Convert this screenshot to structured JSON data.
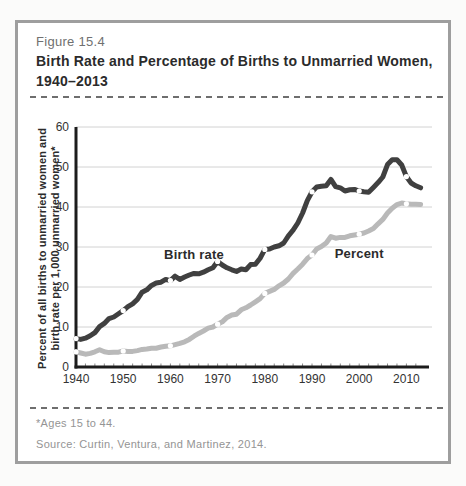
{
  "figure": {
    "label": "Figure 15.4",
    "title_lines": [
      "Birth Rate and Percentage of Births to Unmarried Women,",
      "1940–2013"
    ]
  },
  "colors": {
    "birth_rate_line": "#404040",
    "percent_line": "#b9b9b9",
    "grid": "#d2d2d2",
    "axis": "#1c1c1c",
    "minor_tick": "#8a8a8a",
    "marker_fill": "#ffffff",
    "panel_border": "#9e9e9e"
  },
  "chart_data": {
    "type": "line",
    "title": "Birth Rate and Percentage of Births to Unmarried Women, 1940–2013",
    "xlabel": "",
    "ylabel": "Percent of all births to unmarried women and birth rate per 1,000 unmarried women*",
    "ylabel_lines": [
      "Percent of all births to unmarried women and",
      "birth rate per 1,000 unmarried women*"
    ],
    "xlim": [
      1940,
      2015
    ],
    "ylim": [
      0,
      60
    ],
    "x_ticks": [
      1940,
      1950,
      1960,
      1970,
      1980,
      1990,
      2000,
      2010
    ],
    "y_ticks": [
      0,
      10,
      20,
      30,
      40,
      50,
      60
    ],
    "grid": "horizontal",
    "legend_position": "inline-labels",
    "series": [
      {
        "name": "Percent",
        "color": "#b9b9b9",
        "marker_years": [
          1940,
          1950,
          1960,
          1970,
          1980,
          1990,
          2000,
          2010
        ],
        "points": [
          [
            1940,
            3.8
          ],
          [
            1941,
            3.5
          ],
          [
            1942,
            3.2
          ],
          [
            1943,
            3.4
          ],
          [
            1944,
            3.8
          ],
          [
            1945,
            4.3
          ],
          [
            1946,
            3.8
          ],
          [
            1947,
            3.6
          ],
          [
            1948,
            3.7
          ],
          [
            1949,
            3.7
          ],
          [
            1950,
            4.0
          ],
          [
            1951,
            3.9
          ],
          [
            1952,
            3.9
          ],
          [
            1953,
            4.1
          ],
          [
            1954,
            4.4
          ],
          [
            1955,
            4.5
          ],
          [
            1956,
            4.7
          ],
          [
            1957,
            4.7
          ],
          [
            1958,
            5.0
          ],
          [
            1959,
            5.2
          ],
          [
            1960,
            5.3
          ],
          [
            1961,
            5.6
          ],
          [
            1962,
            5.9
          ],
          [
            1963,
            6.3
          ],
          [
            1964,
            6.9
          ],
          [
            1965,
            7.7
          ],
          [
            1966,
            8.4
          ],
          [
            1967,
            9.0
          ],
          [
            1968,
            9.7
          ],
          [
            1969,
            10.0
          ],
          [
            1970,
            10.7
          ],
          [
            1971,
            11.3
          ],
          [
            1972,
            12.4
          ],
          [
            1973,
            13.0
          ],
          [
            1974,
            13.2
          ],
          [
            1975,
            14.3
          ],
          [
            1976,
            14.8
          ],
          [
            1977,
            15.5
          ],
          [
            1978,
            16.3
          ],
          [
            1979,
            17.1
          ],
          [
            1980,
            18.4
          ],
          [
            1981,
            18.9
          ],
          [
            1982,
            19.4
          ],
          [
            1983,
            20.3
          ],
          [
            1984,
            21.0
          ],
          [
            1985,
            22.0
          ],
          [
            1986,
            23.4
          ],
          [
            1987,
            24.5
          ],
          [
            1988,
            25.7
          ],
          [
            1989,
            27.1
          ],
          [
            1990,
            28.0
          ],
          [
            1991,
            29.5
          ],
          [
            1992,
            30.1
          ],
          [
            1993,
            31.0
          ],
          [
            1994,
            32.6
          ],
          [
            1995,
            32.2
          ],
          [
            1996,
            32.4
          ],
          [
            1997,
            32.4
          ],
          [
            1998,
            32.8
          ],
          [
            1999,
            33.0
          ],
          [
            2000,
            33.2
          ],
          [
            2001,
            33.5
          ],
          [
            2002,
            34.0
          ],
          [
            2003,
            34.6
          ],
          [
            2004,
            35.8
          ],
          [
            2005,
            36.9
          ],
          [
            2006,
            38.5
          ],
          [
            2007,
            39.7
          ],
          [
            2008,
            40.6
          ],
          [
            2009,
            41.0
          ],
          [
            2010,
            40.8
          ],
          [
            2011,
            40.7
          ],
          [
            2012,
            40.7
          ],
          [
            2013,
            40.6
          ]
        ]
      },
      {
        "name": "Birth rate",
        "color": "#404040",
        "marker_years": [
          1940,
          1950,
          1960,
          1970,
          1980,
          1990,
          2000,
          2010
        ],
        "points": [
          [
            1940,
            7.1
          ],
          [
            1941,
            6.9
          ],
          [
            1942,
            7.2
          ],
          [
            1943,
            7.8
          ],
          [
            1944,
            8.6
          ],
          [
            1945,
            10.1
          ],
          [
            1946,
            10.9
          ],
          [
            1947,
            12.1
          ],
          [
            1948,
            12.5
          ],
          [
            1949,
            13.3
          ],
          [
            1950,
            14.1
          ],
          [
            1951,
            15.1
          ],
          [
            1952,
            15.8
          ],
          [
            1953,
            16.9
          ],
          [
            1954,
            18.7
          ],
          [
            1955,
            19.3
          ],
          [
            1956,
            20.4
          ],
          [
            1957,
            21.0
          ],
          [
            1958,
            21.2
          ],
          [
            1959,
            21.9
          ],
          [
            1960,
            21.6
          ],
          [
            1961,
            22.7
          ],
          [
            1962,
            21.9
          ],
          [
            1963,
            22.5
          ],
          [
            1964,
            23.0
          ],
          [
            1965,
            23.4
          ],
          [
            1966,
            23.3
          ],
          [
            1967,
            23.7
          ],
          [
            1968,
            24.3
          ],
          [
            1969,
            24.8
          ],
          [
            1970,
            26.4
          ],
          [
            1971,
            25.5
          ],
          [
            1972,
            24.8
          ],
          [
            1973,
            24.3
          ],
          [
            1974,
            23.9
          ],
          [
            1975,
            24.5
          ],
          [
            1976,
            24.3
          ],
          [
            1977,
            25.6
          ],
          [
            1978,
            25.7
          ],
          [
            1979,
            27.2
          ],
          [
            1980,
            29.4
          ],
          [
            1981,
            29.5
          ],
          [
            1982,
            30.0
          ],
          [
            1983,
            30.3
          ],
          [
            1984,
            31.0
          ],
          [
            1985,
            32.8
          ],
          [
            1986,
            34.2
          ],
          [
            1987,
            36.0
          ],
          [
            1988,
            38.5
          ],
          [
            1989,
            41.6
          ],
          [
            1990,
            43.8
          ],
          [
            1991,
            45.0
          ],
          [
            1992,
            45.2
          ],
          [
            1993,
            45.3
          ],
          [
            1994,
            46.9
          ],
          [
            1995,
            45.1
          ],
          [
            1996,
            44.8
          ],
          [
            1997,
            44.0
          ],
          [
            1998,
            44.3
          ],
          [
            1999,
            44.4
          ],
          [
            2000,
            44.0
          ],
          [
            2001,
            43.8
          ],
          [
            2002,
            43.7
          ],
          [
            2003,
            44.9
          ],
          [
            2004,
            46.1
          ],
          [
            2005,
            47.5
          ],
          [
            2006,
            50.6
          ],
          [
            2007,
            51.8
          ],
          [
            2008,
            51.8
          ],
          [
            2009,
            50.5
          ],
          [
            2010,
            47.6
          ],
          [
            2011,
            46.0
          ],
          [
            2012,
            45.3
          ],
          [
            2013,
            44.8
          ]
        ]
      }
    ],
    "annotations": [
      {
        "text": "Birth rate",
        "year": 1965,
        "value": 27.0
      },
      {
        "text": "Percent",
        "year": 2000,
        "value": 27.3
      }
    ]
  },
  "footer": {
    "footnote": "*Ages 15 to 44.",
    "source": "Source: Curtin, Ventura, and Martinez, 2014."
  }
}
